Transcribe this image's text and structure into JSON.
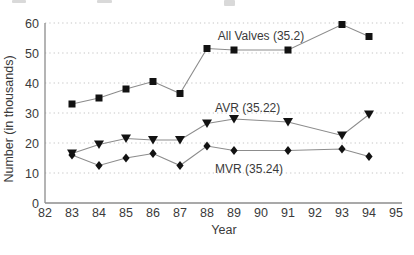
{
  "chart_data": {
    "type": "line",
    "title": "",
    "xlabel": "Year",
    "ylabel": "Number (in thousands)",
    "xlim": [
      82,
      95
    ],
    "ylim": [
      0,
      60
    ],
    "xticks": [
      82,
      83,
      84,
      85,
      86,
      87,
      88,
      89,
      90,
      91,
      92,
      93,
      94,
      95
    ],
    "yticks": [
      0,
      10,
      20,
      30,
      40,
      50,
      60
    ],
    "grid": "horizontal-dotted",
    "legend_position": "inline-annotations",
    "x": [
      83,
      84,
      85,
      86,
      87,
      88,
      89,
      91,
      93,
      94
    ],
    "series": [
      {
        "name": "All Valves (35.2)",
        "marker": "square",
        "values": [
          33,
          35,
          38,
          40.5,
          36.5,
          51.5,
          51,
          51,
          59.5,
          55.5
        ]
      },
      {
        "name": "AVR (35.22)",
        "marker": "triangle-down",
        "values": [
          16.5,
          19.5,
          21.5,
          21,
          21,
          26.5,
          28,
          27,
          22.5,
          29.5
        ]
      },
      {
        "name": "MVR (35.24)",
        "marker": "diamond",
        "values": [
          16,
          12.5,
          15,
          16.5,
          12.5,
          19,
          17.5,
          17.5,
          18,
          15.5
        ]
      }
    ],
    "annotations": [
      {
        "text": "All Valves (35.2)",
        "x": 88.4,
        "y": 55.8
      },
      {
        "text": "AVR (35.22)",
        "x": 88.3,
        "y": 31.8
      },
      {
        "text": "MVR (35.24)",
        "x": 88.3,
        "y": 11.3
      }
    ],
    "colors": {
      "marker": "#121212",
      "line": "#8c8c8c",
      "grid": "#c6c6c6",
      "axis": "#8c8c8c",
      "text": "#3a3a3a"
    }
  }
}
